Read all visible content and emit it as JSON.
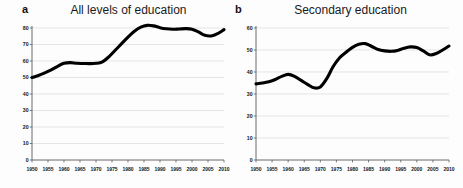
{
  "figure": {
    "background": "#fdfdfd",
    "line_color": "#000000",
    "grid_color": "#d8d8d8",
    "axis_color": "#5a5a5a"
  },
  "panels": [
    {
      "letter": "a",
      "title": "All levels of education"
    },
    {
      "letter": "b",
      "title": "Secondary education"
    }
  ],
  "chart_data": [
    {
      "type": "line",
      "title": "All levels of education",
      "panel_letter": "a",
      "xlabel": "",
      "ylabel": "",
      "xlim": [
        1950,
        2010
      ],
      "ylim": [
        0,
        80
      ],
      "grid": true,
      "legend": "none",
      "yticks": [
        0,
        10,
        20,
        30,
        40,
        50,
        60,
        70,
        80
      ],
      "xticks": [
        1950,
        1955,
        1960,
        1965,
        1970,
        1975,
        1980,
        1985,
        1990,
        1995,
        2000,
        2005,
        2010
      ],
      "x": [
        1950,
        1952,
        1954,
        1956,
        1958,
        1960,
        1962,
        1964,
        1966,
        1968,
        1970,
        1972,
        1974,
        1976,
        1978,
        1980,
        1982,
        1984,
        1986,
        1988,
        1990,
        1992,
        1994,
        1996,
        1998,
        2000,
        2002,
        2004,
        2006,
        2008,
        2010
      ],
      "values": [
        50.0,
        51.2,
        52.8,
        54.6,
        56.8,
        58.6,
        59.0,
        58.6,
        58.5,
        58.4,
        58.6,
        59.5,
        62.5,
        66.5,
        70.5,
        74.5,
        78.0,
        80.5,
        81.6,
        81.3,
        80.2,
        79.5,
        79.2,
        79.4,
        79.6,
        79.3,
        77.6,
        75.6,
        75.2,
        76.6,
        79.0
      ]
    },
    {
      "type": "line",
      "title": "Secondary education",
      "panel_letter": "b",
      "xlabel": "",
      "ylabel": "",
      "xlim": [
        1950,
        2010
      ],
      "ylim": [
        0,
        60
      ],
      "grid": true,
      "legend": "none",
      "yticks": [
        0,
        10,
        20,
        30,
        40,
        50,
        60
      ],
      "xticks": [
        1950,
        1955,
        1960,
        1965,
        1970,
        1975,
        1980,
        1985,
        1990,
        1995,
        2000,
        2005,
        2010
      ],
      "x": [
        1950,
        1952,
        1954,
        1956,
        1958,
        1960,
        1962,
        1964,
        1966,
        1968,
        1970,
        1972,
        1974,
        1976,
        1978,
        1980,
        1982,
        1984,
        1986,
        1988,
        1990,
        1992,
        1994,
        1996,
        1998,
        2000,
        2002,
        2004,
        2006,
        2008,
        2010
      ],
      "values": [
        34.6,
        35.0,
        35.6,
        36.6,
        38.0,
        38.9,
        38.0,
        36.2,
        34.4,
        32.8,
        33.2,
        37.0,
        42.5,
        46.5,
        49.0,
        51.2,
        52.6,
        52.9,
        51.6,
        50.2,
        49.6,
        49.4,
        49.8,
        50.8,
        51.4,
        51.1,
        49.6,
        47.8,
        48.4,
        50.0,
        51.8
      ]
    }
  ]
}
